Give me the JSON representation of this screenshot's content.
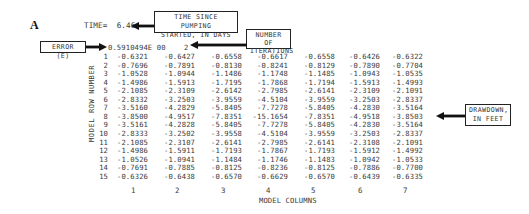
{
  "panel_label": "A",
  "time": {
    "label": "TIME=",
    "value": "6.46"
  },
  "callouts": {
    "time": [
      "TIME SINCE PUMPING",
      "STARTED, IN DAYS"
    ],
    "iterations": [
      "NUMBER  OF",
      "ITERATIONS"
    ],
    "error": "ERROR (E)",
    "drawdown": [
      "DRAWDOWN,",
      "IN FEET"
    ]
  },
  "error_value": "0.5910494E 00",
  "iterations_value": "2",
  "axis": {
    "rows_label": "MODEL ROW NUMBER",
    "cols_label": "MODEL COLUMNS"
  },
  "columns": [
    "1",
    "2",
    "3",
    "4",
    "5",
    "6",
    "7"
  ],
  "rows": [
    {
      "n": "1",
      "v": [
        "-0.6321",
        "-0.6427",
        "-0.6558",
        "-0.6617",
        "-0.6558",
        "-0.6426",
        "-0.6322"
      ]
    },
    {
      "n": "2",
      "v": [
        "-0.7696",
        "-0.7891",
        "-0.8130",
        "-0.8241",
        "-0.8129",
        "-0.7890",
        "-0.7704"
      ]
    },
    {
      "n": "3",
      "v": [
        "-1.0528",
        "-1.0944",
        "-1.1486",
        "-1.1748",
        "-1.1485",
        "-1.0943",
        "-1.0535"
      ]
    },
    {
      "n": "4",
      "v": [
        "-1.4986",
        "-1.5913",
        "-1.7195",
        "-1.7868",
        "-1.7194",
        "-1.5913",
        "-1.4993"
      ]
    },
    {
      "n": "5",
      "v": [
        "-2.1085",
        "-2.3109",
        "-2.6142",
        "-2.7985",
        "-2.6141",
        "-2.3109",
        "-2.1091"
      ]
    },
    {
      "n": "6",
      "v": [
        "-2.8332",
        "-3.2503",
        "-3.9559",
        "-4.5104",
        "-3.9559",
        "-3.2503",
        "-2.8337"
      ]
    },
    {
      "n": "7",
      "v": [
        "-3.5160",
        "-4.2829",
        "-5.8405",
        "-7.7278",
        "-5.8405",
        "-4.2830",
        "-3.5164"
      ]
    },
    {
      "n": "8",
      "v": [
        "-3.8500",
        "-4.9517",
        "-7.8351",
        "-15.1654",
        "-7.8351",
        "-4.9518",
        "-3.8503"
      ]
    },
    {
      "n": "9",
      "v": [
        "-3.5161",
        "-4.2828",
        "-5.8405",
        "-7.7278",
        "-5.8405",
        "-4.2830",
        "-3.5164"
      ]
    },
    {
      "n": "10",
      "v": [
        "-2.8333",
        "-3.2502",
        "-3.9558",
        "-4.5104",
        "-3.9559",
        "-3.2503",
        "-2.8337"
      ]
    },
    {
      "n": "11",
      "v": [
        "-2.1085",
        "-2.3107",
        "-2.6141",
        "-2.7985",
        "-2.6141",
        "-2.3108",
        "-2.1091"
      ]
    },
    {
      "n": "12",
      "v": [
        "-1.4986",
        "-1.5911",
        "-1.7193",
        "-1.7867",
        "-1.7193",
        "-1.5912",
        "-1.4992"
      ]
    },
    {
      "n": "13",
      "v": [
        "-1.0526",
        "-1.0941",
        "-1.1484",
        "-1.1746",
        "-1.1483",
        "-1.0942",
        "-1.0533"
      ]
    },
    {
      "n": "14",
      "v": [
        "-0.7691",
        "-0.7885",
        "-0.8125",
        "-0.8236",
        "-0.8125",
        "-0.7886",
        "-0.7700"
      ]
    },
    {
      "n": "15",
      "v": [
        "-0.6326",
        "-0.6438",
        "-0.6570",
        "-0.6629",
        "-0.6570",
        "-0.6439",
        "-0.6335"
      ]
    }
  ]
}
